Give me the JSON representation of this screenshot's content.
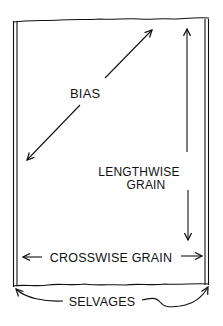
{
  "diagram": {
    "labels": {
      "bias": "BIAS",
      "lengthwise_line1": "LENGTHWISE",
      "lengthwise_line2": "GRAIN",
      "crosswise": "CROSSWISE GRAIN",
      "selvages": "SELVAGES"
    },
    "colors": {
      "ink": "#111111",
      "background": "#ffffff"
    }
  }
}
